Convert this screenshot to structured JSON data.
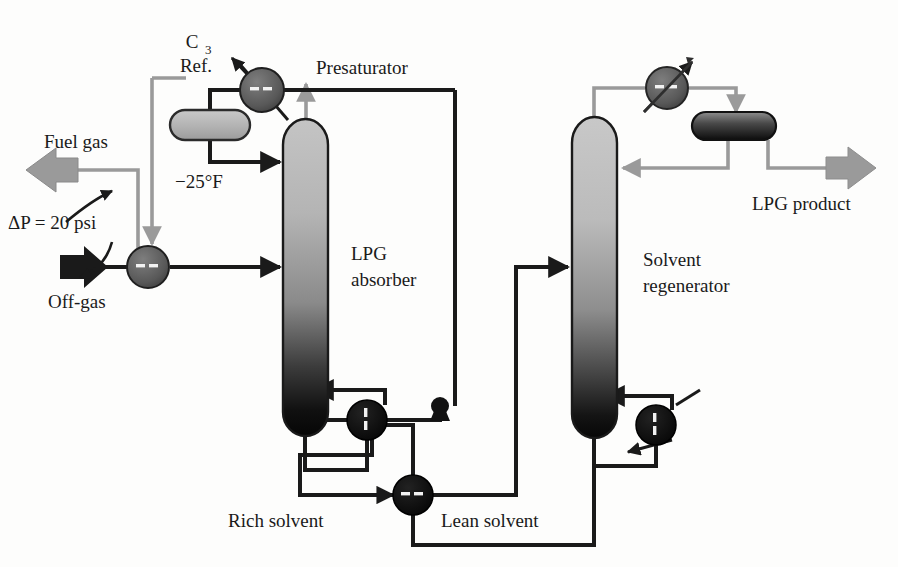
{
  "diagram": {
    "labels": {
      "c3_ref_line1": "C",
      "c3_ref_sub": "3",
      "c3_ref_line2": "Ref.",
      "presaturator": "Presaturator",
      "fuel_gas": "Fuel gas",
      "delta_p": "ΔP = 20 psi",
      "off_gas": "Off-gas",
      "temp_minus25": "−25°F",
      "lpg_absorber_line1": "LPG",
      "lpg_absorber_line2": "absorber",
      "solvent_regenerator_line1": "Solvent",
      "solvent_regenerator_line2": "regenerator",
      "lpg_product": "LPG product",
      "rich_solvent": "Rich solvent",
      "lean_solvent": "Lean solvent"
    },
    "equipment": [
      {
        "id": "c3-refrigerant-condenser",
        "kind": "heat-exchanger",
        "name": "C3 Ref. condenser",
        "cx": 262,
        "cy": 90,
        "r": 22,
        "tone": "gray"
      },
      {
        "id": "presaturator-reflux-drum",
        "kind": "drum",
        "name": "Presaturator reflux drum",
        "x": 170,
        "y": 110,
        "w": 80,
        "h": 30,
        "tone": "gray"
      },
      {
        "id": "off-gas-exchanger",
        "kind": "heat-exchanger",
        "name": "Off-gas chiller",
        "cx": 148,
        "cy": 267,
        "r": 21,
        "tone": "gray"
      },
      {
        "id": "lpg-absorber-column",
        "kind": "column",
        "name": "LPG absorber",
        "x": 283,
        "y": 122,
        "w": 45,
        "h": 312,
        "tone": "gradient-dark"
      },
      {
        "id": "solvent-regenerator-column",
        "kind": "column",
        "name": "Solvent regenerator",
        "x": 572,
        "y": 118,
        "w": 45,
        "h": 318,
        "tone": "gradient-dark"
      },
      {
        "id": "regenerator-overhead-condenser",
        "kind": "heat-exchanger",
        "name": "Regenerator overhead condenser",
        "cx": 667,
        "cy": 88,
        "r": 21,
        "tone": "gray-arrow"
      },
      {
        "id": "lpg-reflux-drum",
        "kind": "drum",
        "name": "LPG reflux drum",
        "x": 692,
        "y": 112,
        "w": 84,
        "h": 28,
        "tone": "dark"
      },
      {
        "id": "rich-solvent-pump",
        "kind": "pump",
        "name": "Rich solvent pump",
        "cx": 440,
        "cy": 408,
        "r": 10
      },
      {
        "id": "absorber-bottom-reboiler",
        "kind": "reboiler",
        "name": "Absorber bottoms reboiler",
        "cx": 367,
        "cy": 420,
        "r": 20
      },
      {
        "id": "regenerator-reboiler",
        "kind": "reboiler",
        "name": "Regenerator reboiler",
        "cx": 656,
        "cy": 425,
        "r": 20
      },
      {
        "id": "lean-solvent-cooler",
        "kind": "heat-exchanger",
        "name": "Lean solvent cooler",
        "cx": 413,
        "cy": 495,
        "r": 20,
        "tone": "dark"
      }
    ],
    "streams": [
      {
        "id": "fuel-gas-outlet",
        "name": "Fuel gas",
        "tone": "gray",
        "arrow": "left"
      },
      {
        "id": "off-gas-inlet",
        "name": "Off-gas",
        "tone": "black",
        "arrow": "right"
      },
      {
        "id": "lpg-product-outlet",
        "name": "LPG product",
        "tone": "gray",
        "arrow": "right"
      },
      {
        "id": "rich-solvent-line",
        "name": "Rich solvent",
        "tone": "black"
      },
      {
        "id": "lean-solvent-line",
        "name": "Lean solvent",
        "tone": "black"
      }
    ],
    "colors": {
      "line_black": "#1a1a1a",
      "line_gray": "#9a9a9a",
      "vessel_light": "#bdbdbd",
      "vessel_dark": "#111111",
      "exchanger_gray": "#5e5e5e",
      "exchanger_black": "#0d0d0d",
      "background": "#fdfdfc"
    }
  }
}
